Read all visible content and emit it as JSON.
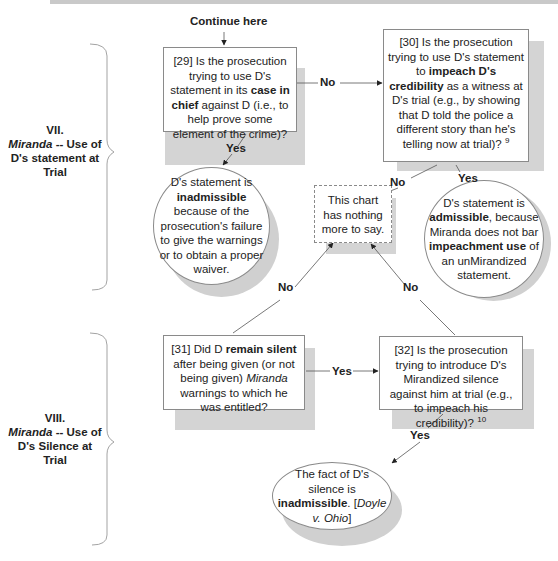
{
  "start_label": "Continue here",
  "sections": [
    {
      "numeral": "VII.",
      "italic": "Miranda",
      "rest": " -- Use of",
      "line2": "D's statement at",
      "line3": "Trial"
    },
    {
      "numeral": "VIII.",
      "italic": "Miranda",
      "rest": " -- Use of",
      "line2": "D's Silence at",
      "line3": "Trial"
    }
  ],
  "nodes": {
    "q29": {
      "pre": "[29] Is the prosecution trying to use D's statement in its ",
      "bold": "case in chief",
      "post": " against D (i.e., to help prove some element of the crime)?"
    },
    "q30": {
      "pre": "[30] Is the prosecution trying to use D's statement to ",
      "bold": "impeach D's credibility",
      "post": " as a witness at D's trial (e.g., by showing that D told the police a different story than he's telling now at trial)? ",
      "footnote": "9"
    },
    "end_inadmissible": {
      "pre": "D's statement is ",
      "bold": "inadmissible",
      "post": " because of the prosecution's failure to give the warnings or to obtain a proper waiver."
    },
    "end_nothing": {
      "text": "This chart has nothing more to say."
    },
    "end_admissible": {
      "pre": "D's statement is ",
      "bold": "admissible",
      "mid": ", because Miranda does not bar ",
      "bold2": "impeachment use",
      "post": " of an unMirandized statement."
    },
    "q31": {
      "pre": "[31] Did D ",
      "bold": "remain silent",
      "mid": " after being given (or not being given) ",
      "italic": "Miranda",
      "post": " warnings to which he was entitled?"
    },
    "q32": {
      "pre": "[32] Is the prosecution trying to introduce D's Mirandized silence against him at trial (e.g., to impeach his credibility)? ",
      "footnote": "10"
    },
    "end_silence": {
      "pre": "The fact of D's silence is ",
      "bold": "inadmissible",
      "mid": ". [",
      "italic": "Doyle v. Ohio",
      "post": "]"
    }
  },
  "edges": {
    "q29_no": "No",
    "q29_yes": "Yes",
    "q30_no": "No",
    "q30_yes": "Yes",
    "q31_no": "No",
    "q31_yes": "Yes",
    "q32_no": "No",
    "q32_yes": "Yes"
  }
}
